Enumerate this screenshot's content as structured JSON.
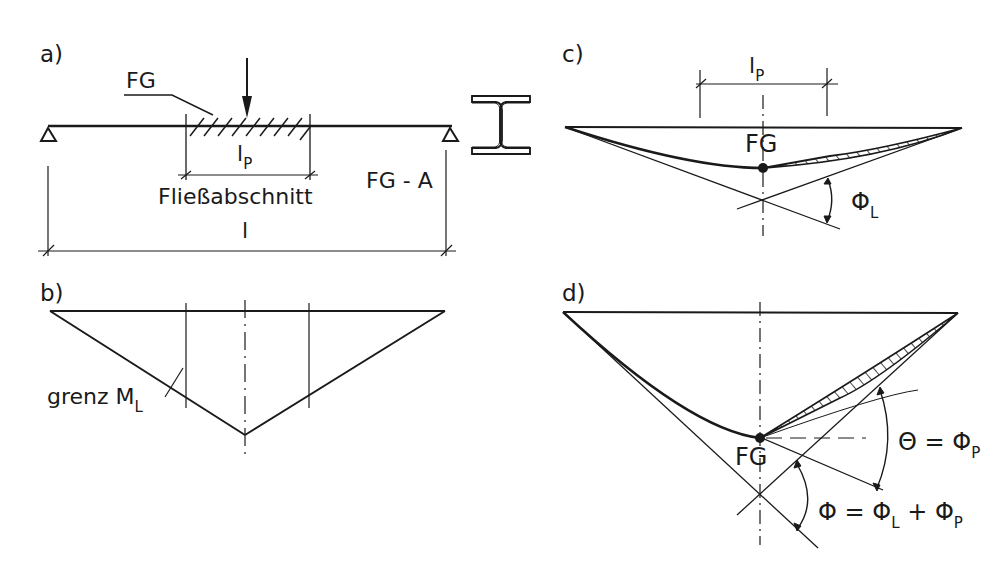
{
  "figure": {
    "panels": {
      "a": {
        "label": "a)",
        "fg": "FG",
        "lp": "l",
        "lp_sub": "P",
        "section": "Fließabschnitt",
        "fga": "FG - A",
        "span": "l",
        "cross_section": "I-beam"
      },
      "b": {
        "label": "b)",
        "grenz": "grenz M",
        "grenz_sub": "L"
      },
      "c": {
        "label": "c)",
        "lp": "l",
        "lp_sub": "P",
        "fg": "FG",
        "phi": "Φ",
        "phi_sub": "L"
      },
      "d": {
        "label": "d)",
        "fg": "FG",
        "theta_lhs": "Θ = Φ",
        "theta_sub": "P",
        "phi_lhs": "Φ = Φ",
        "phi_sub1": "L",
        "phi_plus": " + Φ",
        "phi_sub2": "P"
      }
    },
    "colors": {
      "ink": "#1a1a1a",
      "background": "#ffffff"
    }
  }
}
